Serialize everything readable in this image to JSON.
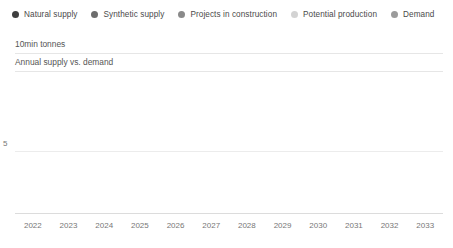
{
  "legend": {
    "items": [
      {
        "label": "Natural supply",
        "key": "natural",
        "color": "#3f3f3f"
      },
      {
        "label": "Synthetic supply",
        "key": "synthetic",
        "color": "#6d6d6d"
      },
      {
        "label": "Projects in construction",
        "key": "projects",
        "color": "#8a8a8a"
      },
      {
        "label": "Potential production",
        "key": "potential",
        "color": "#d3d3d3"
      },
      {
        "label": "Demand",
        "key": "demand",
        "color": "#9b9b9b"
      }
    ]
  },
  "header": {
    "unit": "10min tonnes",
    "subtitle": "Annual supply vs. demand"
  },
  "axis": {
    "y_ticks": [
      "5"
    ],
    "y_tick_values": [
      5
    ]
  },
  "chart_data": {
    "type": "bar",
    "title": "Annual supply vs. demand",
    "subtitle": "Annual supply vs. demand",
    "xlabel": "",
    "ylabel": "10min tonnes",
    "unit": "10min tonnes",
    "ylim": [
      0,
      11.5
    ],
    "grid": true,
    "gridlines": [
      5
    ],
    "legend_position": "top-left",
    "stacked": true,
    "grouping": "supply stack vs. demand bar per year",
    "categories": [
      "2022",
      "2023",
      "2024",
      "2025",
      "2026",
      "2027",
      "2028",
      "2029",
      "2030",
      "2031",
      "2032",
      "2033"
    ],
    "series": [
      {
        "name": "Natural supply",
        "stack": "supply",
        "color": "#3f3f3f",
        "values": [
          1.6,
          1.7,
          1.8,
          1.8,
          1.9,
          1.9,
          2.0,
          2.0,
          2.1,
          2.1,
          2.1,
          2.2
        ]
      },
      {
        "name": "Synthetic supply",
        "stack": "supply",
        "color": "#6d6d6d",
        "values": [
          2.1,
          2.6,
          3.1,
          3.4,
          3.8,
          4.1,
          4.4,
          4.7,
          5.0,
          5.2,
          5.4,
          5.6
        ]
      },
      {
        "name": "Projects in construction",
        "stack": "supply",
        "color": "#8a8a8a",
        "values": [
          0.0,
          0.0,
          0.3,
          0.4,
          0.5,
          0.6,
          0.7,
          0.8,
          0.9,
          0.9,
          1.0,
          1.0
        ]
      },
      {
        "name": "Potential production",
        "stack": "supply",
        "color": "#d3d3d3",
        "values": [
          0.0,
          0.0,
          0.0,
          0.0,
          0.2,
          0.5,
          0.9,
          1.3,
          1.7,
          2.1,
          2.5,
          2.8
        ]
      },
      {
        "name": "Demand",
        "stack": "demand",
        "color": "#9b9b9b",
        "values": [
          3.3,
          4.0,
          4.7,
          5.3,
          6.0,
          6.6,
          7.2,
          7.9,
          8.6,
          9.3,
          10.0,
          10.8
        ]
      }
    ]
  }
}
